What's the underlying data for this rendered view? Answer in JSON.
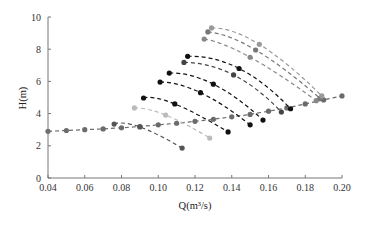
{
  "chart_data": {
    "type": "line",
    "title": "",
    "xlabel": "Q(m³/s)",
    "ylabel": "H(m)",
    "xlim": [
      0.04,
      0.2
    ],
    "ylim": [
      0,
      10
    ],
    "x_ticks": [
      "0.04",
      "0.06",
      "0.08",
      "0.10",
      "0.12",
      "0.14",
      "0.16",
      "0.18",
      "0.20"
    ],
    "y_ticks": [
      "0",
      "2",
      "4",
      "6",
      "8",
      "10"
    ],
    "grid": false,
    "legend": null,
    "series": [
      {
        "name": "system-curve",
        "color": "#6b6b6b",
        "x": [
          0.04,
          0.05,
          0.06,
          0.07,
          0.08,
          0.09,
          0.1,
          0.11,
          0.12,
          0.13,
          0.14,
          0.15,
          0.16,
          0.17,
          0.18,
          0.19,
          0.2
        ],
        "y": [
          2.9,
          2.95,
          3.0,
          3.05,
          3.12,
          3.2,
          3.3,
          3.4,
          3.52,
          3.65,
          3.8,
          3.95,
          4.15,
          4.35,
          4.6,
          4.85,
          5.1
        ]
      },
      {
        "name": "pump-curve-1",
        "color": "#555555",
        "x": [
          0.076,
          0.09,
          0.113
        ],
        "y": [
          3.35,
          3.17,
          1.86
        ]
      },
      {
        "name": "pump-curve-2",
        "color": "#bbbbbb",
        "x": [
          0.087,
          0.104,
          0.128
        ],
        "y": [
          4.35,
          3.91,
          2.48
        ]
      },
      {
        "name": "pump-curve-3",
        "color": "#111111",
        "x": [
          0.092,
          0.109,
          0.138
        ],
        "y": [
          4.97,
          4.6,
          2.86
        ]
      },
      {
        "name": "pump-curve-4",
        "color": "#111111",
        "x": [
          0.101,
          0.123,
          0.15
        ],
        "y": [
          5.96,
          5.3,
          3.3
        ]
      },
      {
        "name": "pump-curve-5",
        "color": "#111111",
        "x": [
          0.106,
          0.13,
          0.157
        ],
        "y": [
          6.52,
          5.83,
          3.6
        ]
      },
      {
        "name": "pump-curve-6",
        "color": "#444444",
        "x": [
          0.114,
          0.141,
          0.167
        ],
        "y": [
          7.18,
          6.4,
          4.1
        ]
      },
      {
        "name": "pump-curve-7",
        "color": "#111111",
        "x": [
          0.116,
          0.144,
          0.172
        ],
        "y": [
          7.56,
          6.8,
          4.3
        ]
      },
      {
        "name": "pump-curve-8",
        "color": "#888888",
        "x": [
          0.125,
          0.15,
          0.186
        ],
        "y": [
          8.63,
          7.5,
          4.8
        ]
      },
      {
        "name": "pump-curve-9",
        "color": "#777777",
        "x": [
          0.127,
          0.153,
          0.188
        ],
        "y": [
          9.07,
          7.95,
          4.95
        ]
      },
      {
        "name": "pump-curve-10",
        "color": "#999999",
        "x": [
          0.129,
          0.155,
          0.189
        ],
        "y": [
          9.32,
          8.3,
          5.1
        ]
      }
    ]
  }
}
